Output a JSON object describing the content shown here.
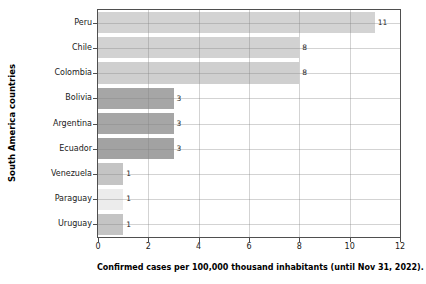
{
  "chart_data": {
    "type": "bar",
    "orientation": "horizontal",
    "title": "",
    "xlabel": "Confirmed cases per 100,000 thousand inhabitants (until Nov 31, 2022).",
    "ylabel": "South America countries",
    "categories": [
      "Peru",
      "Chile",
      "Colombia",
      "Bolivia",
      "Argentina",
      "Ecuador",
      "Venezuela",
      "Paraguay",
      "Uruguay"
    ],
    "values": [
      11,
      8,
      8,
      3,
      3,
      3,
      1,
      1,
      1
    ],
    "value_labels": [
      "11",
      "8",
      "8",
      "3",
      "3",
      "3",
      "1",
      "1",
      "1"
    ],
    "bar_colors": [
      "#d3d3d3",
      "#d2d2d2",
      "#cfcfcf",
      "#a6a6a6",
      "#a6a6a6",
      "#a2a2a2",
      "#c4c4c4",
      "#ececec",
      "#c4c4c4"
    ],
    "xlim": [
      0,
      12
    ],
    "x_ticks": [
      "0",
      "2",
      "4",
      "6",
      "8",
      "10",
      "12"
    ],
    "grid": true,
    "colors": {
      "plot_border": "#4f4f4f",
      "gridline": "#cccccc",
      "text": "#1a1a1a",
      "background": "#ffffff"
    }
  }
}
